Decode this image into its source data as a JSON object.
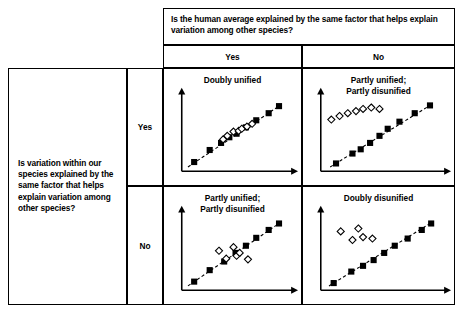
{
  "figure": {
    "type": "2x2-contingency-matrix-with-scatterplots",
    "column_header": {
      "question": "Is the human average explained by the same factor that helps explain variation among other species?",
      "values": [
        "Yes",
        "No"
      ]
    },
    "row_header": {
      "question": "Is variation within our species explained by the same factor that helps explain variation among other species?",
      "values": [
        "Yes",
        "No"
      ]
    },
    "cells": [
      {
        "row": "Yes",
        "col": "Yes",
        "label_lines": [
          "Doubly unified"
        ]
      },
      {
        "row": "Yes",
        "col": "No",
        "label_lines": [
          "Partly unified;",
          "Partly disunified"
        ]
      },
      {
        "row": "No",
        "col": "Yes",
        "label_lines": [
          "Partly unified;",
          "Partly disunified"
        ]
      },
      {
        "row": "No",
        "col": "No",
        "label_lines": [
          "Doubly disunified"
        ]
      }
    ]
  },
  "chart_data": [
    {
      "id": "yes-yes",
      "type": "scatter",
      "title": "Doubly unified",
      "xlabel": "",
      "ylabel": "",
      "grid": false,
      "legend": null,
      "axis_style": "arrow-axes-no-ticks",
      "trendline": {
        "style": "dashed",
        "from": [
          6,
          6
        ],
        "to": [
          96,
          94
        ]
      },
      "series": [
        {
          "name": "other-species-filled-squares",
          "marker": "filled-square",
          "points": [
            [
              12,
              13
            ],
            [
              27,
              30
            ],
            [
              38,
              40
            ],
            [
              46,
              48
            ],
            [
              53,
              53
            ],
            [
              62,
              62
            ],
            [
              72,
              72
            ],
            [
              84,
              82
            ],
            [
              94,
              92
            ]
          ]
        },
        {
          "name": "human-open-diamonds",
          "marker": "open-diamond",
          "points": [
            [
              40,
              45
            ],
            [
              44,
              50
            ],
            [
              50,
              56
            ],
            [
              55,
              57
            ],
            [
              58,
              60
            ],
            [
              63,
              63
            ],
            [
              68,
              67
            ]
          ]
        }
      ]
    },
    {
      "id": "yes-no",
      "type": "scatter",
      "title": "Partly unified; Partly disunified",
      "xlabel": "",
      "ylabel": "",
      "grid": false,
      "legend": null,
      "axis_style": "arrow-axes-no-ticks",
      "trendline": {
        "style": "dashed",
        "from": [
          8,
          6
        ],
        "to": [
          95,
          95
        ]
      },
      "series": [
        {
          "name": "other-species-filled-squares",
          "marker": "filled-square",
          "points": [
            [
              13,
              11
            ],
            [
              27,
              25
            ],
            [
              34,
              31
            ],
            [
              42,
              40
            ],
            [
              50,
              50
            ],
            [
              57,
              60
            ],
            [
              67,
              70
            ],
            [
              80,
              82
            ],
            [
              93,
              93
            ]
          ]
        },
        {
          "name": "human-open-diamonds",
          "marker": "open-diamond",
          "points": [
            [
              9,
              73
            ],
            [
              16,
              78
            ],
            [
              23,
              82
            ],
            [
              30,
              85
            ],
            [
              36,
              88
            ],
            [
              43,
              90
            ],
            [
              50,
              88
            ]
          ]
        }
      ]
    },
    {
      "id": "no-yes",
      "type": "scatter",
      "title": "Partly unified; Partly disunified",
      "xlabel": "",
      "ylabel": "",
      "grid": false,
      "legend": null,
      "axis_style": "arrow-axes-no-ticks",
      "trendline": {
        "style": "dashed",
        "from": [
          6,
          6
        ],
        "to": [
          96,
          95
        ]
      },
      "series": [
        {
          "name": "other-species-filled-squares",
          "marker": "filled-square",
          "points": [
            [
              12,
              12
            ],
            [
              27,
              28
            ],
            [
              41,
              40
            ],
            [
              52,
              52
            ],
            [
              62,
              62
            ],
            [
              72,
              73
            ],
            [
              84,
              84
            ],
            [
              94,
              93
            ]
          ]
        },
        {
          "name": "human-open-diamonds",
          "marker": "open-diamond",
          "points": [
            [
              36,
              55
            ],
            [
              43,
              44
            ],
            [
              50,
              60
            ],
            [
              53,
              48
            ],
            [
              56,
              52
            ],
            [
              64,
              43
            ]
          ]
        }
      ]
    },
    {
      "id": "no-no",
      "type": "scatter",
      "title": "Doubly disunified",
      "xlabel": "",
      "ylabel": "",
      "grid": false,
      "legend": null,
      "axis_style": "arrow-axes-no-ticks",
      "trendline": {
        "style": "dashed",
        "from": [
          7,
          6
        ],
        "to": [
          95,
          95
        ]
      },
      "series": [
        {
          "name": "other-species-filled-squares",
          "marker": "filled-square",
          "points": [
            [
              11,
              10
            ],
            [
              26,
              26
            ],
            [
              36,
              34
            ],
            [
              45,
              42
            ],
            [
              54,
              52
            ],
            [
              63,
              62
            ],
            [
              74,
              72
            ],
            [
              86,
              84
            ],
            [
              94,
              93
            ]
          ]
        },
        {
          "name": "human-open-diamonds",
          "marker": "open-diamond",
          "points": [
            [
              17,
              82
            ],
            [
              27,
              70
            ],
            [
              32,
              86
            ],
            [
              36,
              74
            ],
            [
              44,
              72
            ]
          ]
        }
      ]
    }
  ]
}
